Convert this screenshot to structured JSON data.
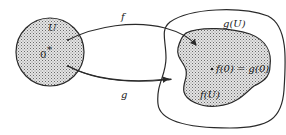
{
  "diagram": {
    "type": "mapping-diagram",
    "domain_set": {
      "label": "U",
      "origin_label": "0"
    },
    "maps": [
      {
        "name": "f",
        "label": "f"
      },
      {
        "name": "g",
        "label": "g"
      }
    ],
    "image_sets": [
      {
        "name": "f(U)",
        "label": "f(U)",
        "shaded": true
      },
      {
        "name": "g(U)",
        "label": "g(U)",
        "shaded": false
      }
    ],
    "point_label": "f(0) = g(0)",
    "colors": {
      "stroke": "#2a2a2a",
      "shade_fill": "#d8d8d8",
      "dots": "#6a6a6a",
      "background": "#ffffff"
    }
  }
}
